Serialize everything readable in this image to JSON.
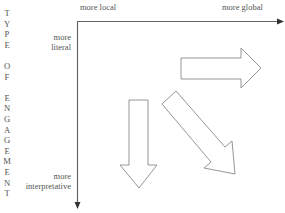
{
  "diagram": {
    "vertical_axis_title_letters": [
      "T",
      "Y",
      "P",
      "E",
      "",
      "O",
      "F",
      "",
      "E",
      "N",
      "G",
      "A",
      "G",
      "E",
      "M",
      "E",
      "N",
      "T"
    ],
    "vertical_axis_title": "TYPE OF ENGAGEMENT",
    "x_axis": {
      "left_label": "more local",
      "right_label": "more global"
    },
    "y_axis": {
      "top_label_line1": "more",
      "top_label_line2": "literal",
      "bottom_label_line1": "more",
      "bottom_label_line2": "interpretative"
    },
    "arrows": [
      {
        "name": "right-arrow",
        "direction": "right",
        "meaning": "toward more global"
      },
      {
        "name": "down-arrow",
        "direction": "down",
        "meaning": "toward more interpretative"
      },
      {
        "name": "diagonal-arrow",
        "direction": "down-right",
        "meaning": "toward more global and more interpretative"
      }
    ],
    "colors": {
      "axis": "#666666",
      "arrow_outline": "#8a8a8a",
      "text": "#555555"
    }
  }
}
